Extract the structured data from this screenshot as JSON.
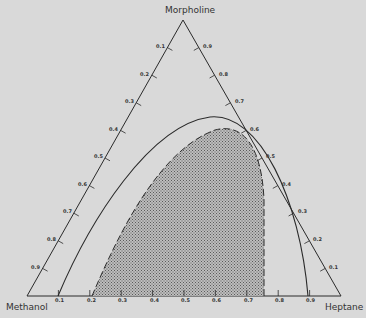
{
  "diagram": {
    "type": "ternary-phase-diagram",
    "vertices": {
      "top": "Morpholine",
      "bottom_left": "Methanol",
      "bottom_right": "Heptane"
    },
    "ticks": {
      "left_edge": [
        "0.1",
        "0.2",
        "0.3",
        "0.4",
        "0.5",
        "0.6",
        "0.7",
        "0.8",
        "0.9"
      ],
      "right_edge": [
        "0.9",
        "0.8",
        "0.7",
        "0.6",
        "0.5",
        "0.4",
        "0.3",
        "0.2",
        "0.1"
      ],
      "bottom_edge": [
        "0.1",
        "0.2",
        "0.3",
        "0.4",
        "0.5",
        "0.6",
        "0.7",
        "0.8",
        "0.9"
      ]
    },
    "curves": [
      {
        "name": "solid-binodal",
        "style": "solid",
        "base_start": 0.1,
        "base_end": 0.9
      },
      {
        "name": "dashed-region-boundary",
        "style": "dashed",
        "base_start": 0.2,
        "base_end": 0.75,
        "fill": "stippled"
      }
    ],
    "colors": {
      "background": "#d9d9d9",
      "line": "#2a2a2a",
      "fill": "#9a9a9a"
    }
  }
}
